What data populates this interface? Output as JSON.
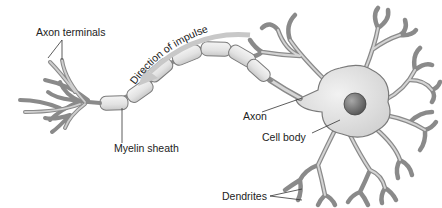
{
  "diagram": {
    "labels": {
      "axon_terminals": "Axon terminals",
      "direction": "Direction of impulse",
      "axon": "Axon",
      "cell_body": "Cell body",
      "myelin_sheath": "Myelin sheath",
      "dendrites": "Dendrites"
    },
    "colors": {
      "membrane_fill": "#d9d9d9",
      "membrane_stroke": "#7a7a7a",
      "myelin_fill": "#e6e6e6",
      "nucleus": "#6a6a6a",
      "arrow": "#c8c8c8",
      "text": "#222222"
    }
  }
}
